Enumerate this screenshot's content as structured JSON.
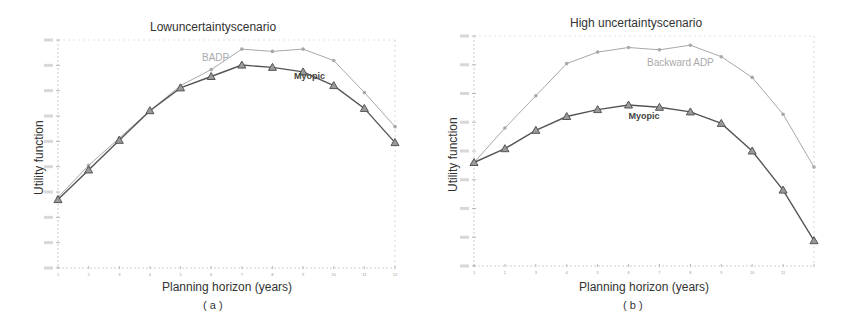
{
  "chart_data": [
    {
      "type": "line",
      "panel": "a",
      "title": "Lowuncertaintyscenario",
      "xlabel": "Planning horizon (years)",
      "ylabel": "Utility function",
      "caption": "( a )",
      "x": [
        1,
        2,
        3,
        4,
        5,
        6,
        7,
        8,
        9,
        10,
        11,
        12
      ],
      "xticks": [
        "1",
        "2",
        "3",
        "4",
        "5",
        "6",
        "7",
        "8",
        "9",
        "10",
        "11",
        "12"
      ],
      "ylim": [
        0,
        100
      ],
      "y_note": "tick labels illegible; values normalized 0-100 relative to axis range",
      "grid": false,
      "series": [
        {
          "name": "BADP",
          "color": "#a8a8a8",
          "marker": "dot",
          "values": [
            31,
            45,
            57,
            69,
            80,
            87,
            96,
            95,
            96,
            91,
            77,
            62
          ]
        },
        {
          "name": "Myopic",
          "color": "#555555",
          "marker": "triangle",
          "values": [
            30,
            43,
            56,
            69,
            79,
            84,
            89,
            88,
            86,
            80,
            70,
            55
          ]
        }
      ],
      "annotations": [
        {
          "text": "BADP",
          "x": 5.7,
          "y": 91
        },
        {
          "text": "Myopic",
          "x": 8.7,
          "y": 83
        }
      ]
    },
    {
      "type": "line",
      "panel": "b",
      "title": "High uncertaintyscenario",
      "xlabel": "Planning horizon (years)",
      "ylabel": "Utility function",
      "caption": "( b )",
      "x": [
        1,
        2,
        3,
        4,
        5,
        6,
        7,
        8,
        9,
        10,
        11,
        12
      ],
      "xticks": [
        "1",
        "2",
        "3",
        "4",
        "5",
        "6",
        "7",
        "8",
        "9",
        "10",
        "11",
        ""
      ],
      "ylim": [
        0,
        100
      ],
      "y_note": "tick labels illegible; values normalized 0-100 relative to axis range",
      "grid": false,
      "series": [
        {
          "name": "Backward ADP",
          "color": "#a8a8a8",
          "marker": "dot",
          "values": [
            45,
            60,
            74,
            88,
            93,
            95,
            94,
            96,
            91,
            82,
            66,
            43
          ]
        },
        {
          "name": "Myopic",
          "color": "#555555",
          "marker": "triangle",
          "values": [
            45,
            51,
            59,
            65,
            68,
            70,
            69,
            67,
            62,
            50,
            33,
            11
          ]
        }
      ],
      "annotations": [
        {
          "text": "Backward ADP",
          "x": 6.6,
          "y": 87
        },
        {
          "text": "Myopic",
          "x": 6.0,
          "y": 64
        }
      ]
    }
  ],
  "panels": {
    "a": {
      "title": "Lowuncertaintyscenario",
      "xlabel": "Planning horizon (years)",
      "ylabel": "Utility function",
      "caption": "( a )",
      "label_badp": "BADP",
      "label_myopic": "Myopic"
    },
    "b": {
      "title": "High uncertaintyscenario",
      "xlabel": "Planning horizon (years)",
      "ylabel": "Utility function",
      "caption": "( b )",
      "label_badp": "Backward ADP",
      "label_myopic": "Myopic"
    }
  }
}
